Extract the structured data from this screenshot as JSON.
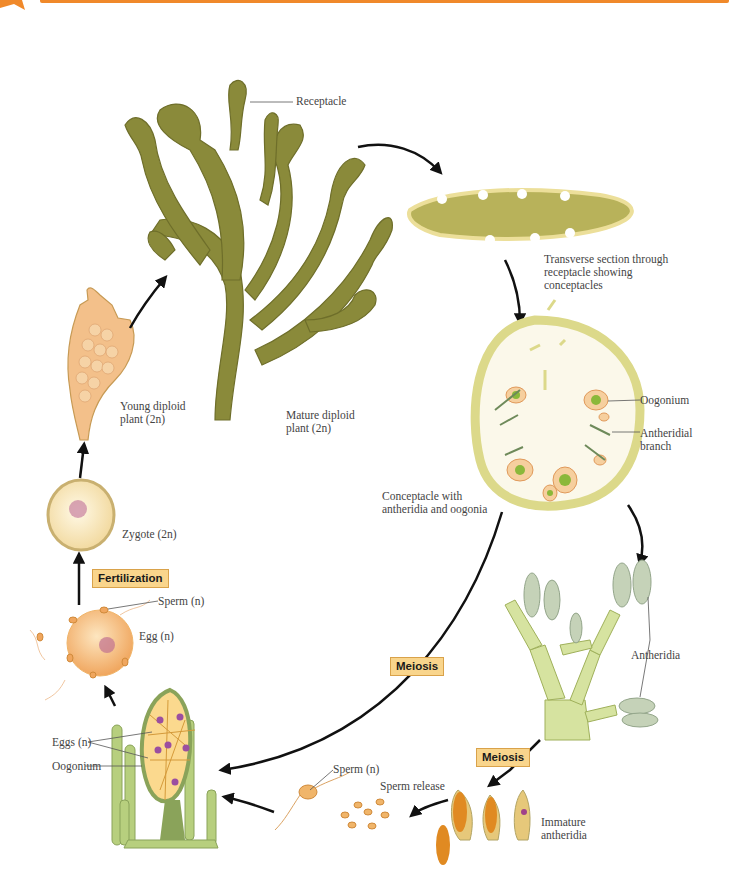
{
  "figure": {
    "accent_color": "#f0892a",
    "tag_bg": "#f9d58c",
    "labels": {
      "receptacle": "Receptacle",
      "transverse_section": [
        "Transverse section through",
        "receptacle showing",
        "conceptacles"
      ],
      "oogonium_top": "Oogonium",
      "antheridial_branch": [
        "Antheridial",
        "branch"
      ],
      "conceptacle": [
        "Conceptacle with",
        "antheridia and oogonia"
      ],
      "antheridia": "Antheridia",
      "immature_antheridia": [
        "Immature",
        "antheridia"
      ],
      "sperm_release": "Sperm release",
      "sperm_n_bottom": "Sperm (n)",
      "eggs_n": "Eggs (n)",
      "oogonium_bottom": "Oogonium",
      "egg_n": "Egg (n)",
      "sperm_n_top": "Sperm (n)",
      "zygote": "Zygote (2n)",
      "young_plant": [
        "Young diploid",
        "plant (2n)"
      ],
      "mature_plant": [
        "Mature diploid",
        "plant (2n)"
      ]
    },
    "process_tags": {
      "fertilization": "Fertilization",
      "meiosis_center": "Meiosis",
      "meiosis_right": "Meiosis"
    }
  }
}
